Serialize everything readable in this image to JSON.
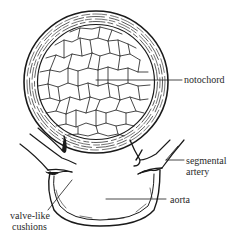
{
  "diagram": {
    "type": "anatomical cross-section illustration",
    "labels": {
      "notochord": "notochord",
      "segmental_artery_line1": "segmental",
      "segmental_artery_line2": "artery",
      "aorta": "aorta",
      "valve_cushions_line1": "valve-like",
      "valve_cushions_line2": "cushions"
    },
    "colors": {
      "ink": "#1a1a1a",
      "background": "#ffffff"
    }
  }
}
